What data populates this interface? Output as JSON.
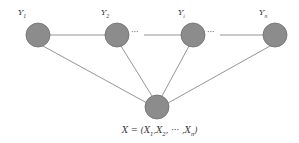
{
  "diagram": {
    "type": "graph",
    "node_color": "#8c8c8c",
    "node_stroke": "#6e6e6e",
    "edge_color": "#7a7a7a",
    "nodes": [
      {
        "id": "Y1",
        "label_base": "Y",
        "label_sub": "1",
        "cx": 38,
        "cy": 35,
        "r": 12
      },
      {
        "id": "Y2",
        "label_base": "Y",
        "label_sub": "2",
        "cx": 117,
        "cy": 35,
        "r": 12
      },
      {
        "id": "Yi",
        "label_base": "Y",
        "label_sub": "i",
        "cx": 193,
        "cy": 35,
        "r": 12
      },
      {
        "id": "Yn",
        "label_base": "Y",
        "label_sub": "n",
        "cx": 275,
        "cy": 35,
        "r": 12
      },
      {
        "id": "X",
        "cx": 157,
        "cy": 107,
        "r": 12
      }
    ],
    "ellipsis": "···",
    "formula": {
      "lhs": "X",
      "eq": " = (",
      "x1": "X",
      "x1_sub": "1",
      "x2": "X",
      "x2_sub": "2",
      "mid": ", ··· ,",
      "xn": "X",
      "xn_sub": "n",
      "close": ")"
    }
  }
}
